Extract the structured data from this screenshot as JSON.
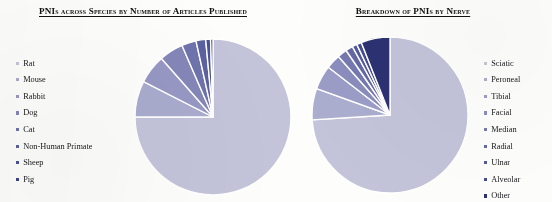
{
  "figure": {
    "background_color": "#fdfdfb",
    "slice_border_color": "#ffffff"
  },
  "left_panel": {
    "title": "PNIs across Species by Number of Articles Published",
    "legend_title": "Species",
    "legend_position": "left"
  },
  "right_panel": {
    "title": "Breakdown of PNIs by Nerve",
    "legend_title": "Nerve",
    "legend_position": "right"
  },
  "chart_data": [
    {
      "type": "pie",
      "title": "PNIs across Species by Number of Articles Published",
      "xlabel": "",
      "ylabel": "",
      "legend_position": "left",
      "start_angle_deg": 0,
      "direction": "clockwise",
      "categories": [
        "Rat",
        "Mouse",
        "Rabbit",
        "Dog",
        "Cat",
        "Non-Human Primate",
        "Sheep",
        "Pig"
      ],
      "values": [
        75.0,
        7.5,
        6.0,
        5.0,
        3.0,
        2.0,
        1.0,
        0.5
      ],
      "unit": "percent",
      "colors": [
        "#c3c4da",
        "#a9abcd",
        "#9698c4",
        "#8386b8",
        "#6f73ac",
        "#5b60a0",
        "#4b5194",
        "#3c4288"
      ]
    },
    {
      "type": "pie",
      "title": "Breakdown of PNIs by Nerve",
      "xlabel": "",
      "ylabel": "",
      "legend_position": "right",
      "start_angle_deg": 0,
      "direction": "clockwise",
      "categories": [
        "Sciatic",
        "Peroneal",
        "Tibial",
        "Facial",
        "Median",
        "Radial",
        "Ulnar",
        "Alveolar",
        "Other"
      ],
      "values": [
        74.0,
        6.5,
        5.0,
        3.0,
        2.0,
        1.5,
        1.0,
        1.0,
        6.0
      ],
      "unit": "percent",
      "colors": [
        "#c3c4da",
        "#acaecf",
        "#9b9dc7",
        "#8a8dbd",
        "#7579b0",
        "#6469a6",
        "#53599a",
        "#454b90",
        "#2b3172"
      ]
    }
  ]
}
